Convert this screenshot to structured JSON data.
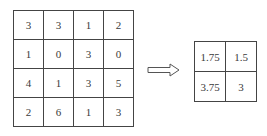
{
  "input_matrix": {
    "rows": [
      [
        "3",
        "3",
        "1",
        "2"
      ],
      [
        "1",
        "0",
        "3",
        "0"
      ],
      [
        "4",
        "1",
        "3",
        "5"
      ],
      [
        "2",
        "6",
        "1",
        "3"
      ]
    ]
  },
  "arrow": {
    "icon": "right-arrow-icon",
    "direction": "right"
  },
  "output_matrix": {
    "rows": [
      [
        "1.75",
        "1.5"
      ],
      [
        "3.75",
        "3"
      ]
    ]
  },
  "colors": {
    "border": "#444444",
    "text": "#3a3a3a",
    "background": "#ffffff"
  }
}
